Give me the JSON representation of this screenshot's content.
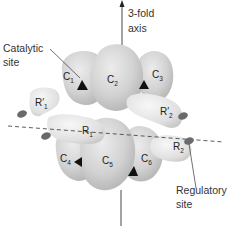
{
  "diagram": {
    "labels": {
      "axis": "3-fold\naxis",
      "axis_line1": "3-fold",
      "axis_line2": "axis",
      "catalytic_line1": "Catalytic",
      "catalytic_line2": "site",
      "regulatory_line1": "Regulatory",
      "regulatory_line2": "site"
    },
    "catalytic_subunits": [
      {
        "name": "C",
        "sub": "1"
      },
      {
        "name": "C",
        "sub": "2"
      },
      {
        "name": "C",
        "sub": "3"
      },
      {
        "name": "C",
        "sub": "4"
      },
      {
        "name": "C",
        "sub": "5"
      },
      {
        "name": "C",
        "sub": "6"
      }
    ],
    "regulatory_subunits": [
      {
        "name": "R′",
        "sub": "1"
      },
      {
        "name": "R",
        "sub": "1"
      },
      {
        "name": "R′",
        "sub": "2"
      },
      {
        "name": "R",
        "sub": "2"
      }
    ],
    "colors": {
      "subunit_fill": "#d6d6d6",
      "subunit_shade": "#b8b8b8",
      "regulatory_fill": "#e8e8e8",
      "site_marker": "#6b6b6b",
      "triangle": "#111111",
      "line": "#333333"
    }
  }
}
